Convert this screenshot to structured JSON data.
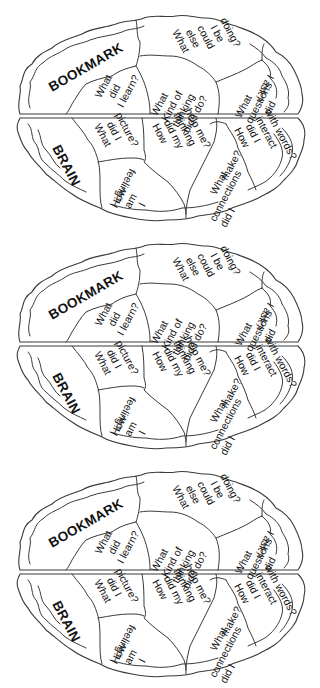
{
  "page": {
    "bookmark_count": 3
  },
  "bookmark": {
    "title_top": "BOOKMARK",
    "title_bottom": "BRAIN",
    "regions": {
      "what_did_i_learn": [
        "What",
        "did",
        "I learn?"
      ],
      "what_kind_of_thinking": [
        "What",
        "Kind of",
        "thinking",
        "did I do?"
      ],
      "what_else_could_i_be_doing": [
        "What",
        "else",
        "could",
        "I be",
        "doing?"
      ],
      "what_questions_did_i_ask": [
        "What",
        "questions",
        "did",
        "I ask?"
      ],
      "what_did_i_picture": [
        "What",
        "did I",
        "picture?"
      ],
      "how_am_i_feeling": [
        "How",
        "am",
        "I",
        "feeling?"
      ],
      "how_did_my_thinking_help_me": [
        "How",
        "did my",
        "thinking",
        "help me?"
      ],
      "what_connections_did_i_make": [
        "What",
        "connections",
        "did I",
        "make?"
      ],
      "how_did_i_interact_with_words": [
        "How",
        "did I",
        "interact",
        "with words?"
      ]
    }
  },
  "colors": {
    "line": "#3a3a3a",
    "text": "#111111",
    "background": "#ffffff"
  }
}
